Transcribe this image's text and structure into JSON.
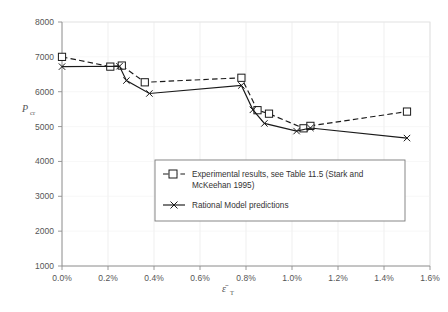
{
  "chart_data": {
    "type": "line",
    "title": "",
    "xlabel": "ε̄T",
    "xlabel_base": "ε̄",
    "xlabel_sub": "T",
    "ylabel": "Pcr",
    "ylabel_base": "P",
    "ylabel_sub": "cr",
    "xlim": [
      0.0,
      1.6
    ],
    "ylim": [
      1000,
      8000
    ],
    "xticks": [
      0.0,
      0.2,
      0.4,
      0.6,
      0.8,
      1.0,
      1.2,
      1.4,
      1.6
    ],
    "xtick_labels": [
      "0.0%",
      "0.2%",
      "0.4%",
      "0.6%",
      "0.8%",
      "1.0%",
      "1.2%",
      "1.4%",
      "1.6%"
    ],
    "yticks": [
      1000,
      2000,
      3000,
      4000,
      5000,
      6000,
      7000,
      8000
    ],
    "ytick_labels": [
      "1000",
      "2000",
      "3000",
      "4000",
      "5000",
      "6000",
      "7000",
      "8000"
    ],
    "grid": true,
    "grid_color": "#e8e8e8",
    "legend_position": "inside-lower-center",
    "series": [
      {
        "name": "Experimental results, see Table 11.5 (Stark and McKeehan 1995)",
        "marker": "square",
        "linestyle": "dashed",
        "color": "#1a1a1a",
        "x": [
          0.0,
          0.21,
          0.26,
          0.36,
          0.78,
          0.85,
          0.9,
          1.05,
          1.08,
          1.5
        ],
        "y": [
          7000,
          6720,
          6750,
          6270,
          6400,
          5470,
          5370,
          4950,
          5020,
          5430
        ]
      },
      {
        "name": "Rational Model predictions",
        "marker": "x",
        "linestyle": "solid",
        "color": "#1a1a1a",
        "x": [
          0.0,
          0.25,
          0.28,
          0.38,
          0.78,
          0.83,
          0.88,
          1.02,
          1.08,
          1.5
        ],
        "y": [
          6720,
          6730,
          6320,
          5950,
          6180,
          5480,
          5090,
          4870,
          4960,
          4670
        ]
      }
    ]
  },
  "legend": {
    "entries": [
      {
        "label_line1": "Experimental results, see Table 11.5 (Stark and",
        "label_line2": "McKeehan 1995)",
        "marker": "square",
        "linestyle": "dashed"
      },
      {
        "label_line1": "Rational Model predictions",
        "label_line2": "",
        "marker": "x",
        "linestyle": "solid"
      }
    ]
  }
}
